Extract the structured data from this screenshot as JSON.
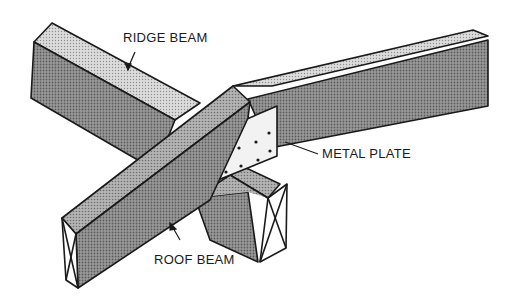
{
  "diagram": {
    "labels": {
      "ridge_beam": "RIDGE BEAM",
      "metal_plate": "METAL PLATE",
      "roof_beam": "ROOF BEAM"
    },
    "colors": {
      "background": "#ffffff",
      "line": "#1a1a1a",
      "shade_dark": "#8a8a8a",
      "shade_mid": "#a8a8a8",
      "shade_light": "#cfcfcf",
      "plate": "#f2f2f2"
    }
  }
}
